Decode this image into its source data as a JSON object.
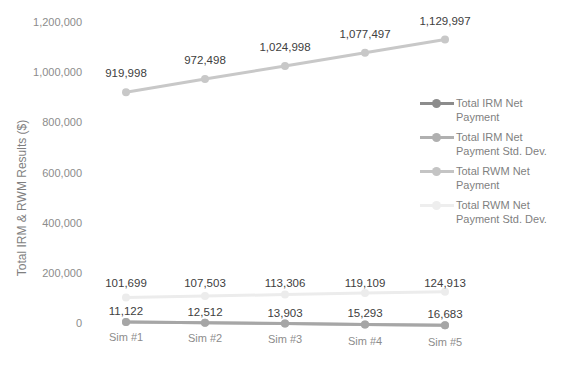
{
  "chart_data": {
    "type": "line",
    "title": "",
    "xlabel": "",
    "ylabel": "Total IRM & RWM Results ($)",
    "categories": [
      "Sim #1",
      "Sim #2",
      "Sim #3",
      "Sim #4",
      "Sim #5"
    ],
    "ylim": [
      0,
      1200000
    ],
    "yticks": [
      "0",
      "200,000",
      "400,000",
      "600,000",
      "800,000",
      "1,000,000",
      "1,200,000"
    ],
    "grid": false,
    "legend_position": "right",
    "series": [
      {
        "name": "Total IRM Net Payment",
        "color": "#a6a6a6",
        "values": [
          11122,
          12512,
          13903,
          15293,
          16683
        ],
        "labels": [
          "11,122",
          "12,512",
          "13,903",
          "15,293",
          "16,683"
        ]
      },
      {
        "name": "Total IRM Net Payment Std. Dev.",
        "color": "#bfbfbf",
        "values": [
          0,
          0,
          0,
          0,
          0
        ],
        "labels": []
      },
      {
        "name": "Total RWM Net Payment",
        "color": "#c8c8c8",
        "values": [
          919998,
          972498,
          1024998,
          1077497,
          1129997
        ],
        "labels": [
          "919,998",
          "972,498",
          "1,024,998",
          "1,077,497",
          "1,129,997"
        ]
      },
      {
        "name": "Total RWM Net Payment Std. Dev.",
        "color": "#ececec",
        "values": [
          101699,
          107503,
          113306,
          119109,
          124913
        ],
        "labels": [
          "101,699",
          "107,503",
          "113,306",
          "119,109",
          "124,913"
        ]
      }
    ]
  },
  "legend": {
    "items": [
      {
        "label": "Total IRM Net Payment",
        "line_color": "#8c8c8c",
        "dot_color": "#8c8c8c"
      },
      {
        "label": "Total IRM Net Payment Std. Dev.",
        "line_color": "#b0b0b0",
        "dot_color": "#b0b0b0"
      },
      {
        "label": "Total RWM Net Payment",
        "line_color": "#c4c4c4",
        "dot_color": "#c4c4c4"
      },
      {
        "label": "Total RWM Net Payment Std. Dev.",
        "line_color": "#eeeeee",
        "dot_color": "#eeeeee"
      }
    ]
  }
}
